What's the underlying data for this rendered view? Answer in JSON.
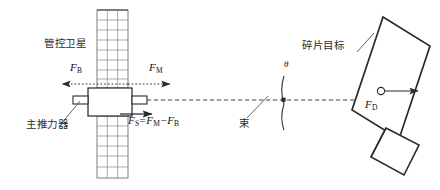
{
  "diagram": {
    "title_hidden": "",
    "satellite": {
      "label": "管控卫星",
      "thruster_label": "主推力器",
      "force_back": {
        "symbol": "F",
        "sub": "B"
      },
      "force_main": {
        "symbol": "F",
        "sub": "M"
      },
      "resultant": {
        "symbol": "F",
        "sub": "S",
        "equals": "=",
        "term1_symbol": "F",
        "term1_sub": "M",
        "minus": "−",
        "term2_symbol": "F",
        "term2_sub": "B"
      }
    },
    "beam": {
      "label": "束",
      "angle_label": "θ"
    },
    "debris": {
      "label": "碎片目标",
      "force": {
        "symbol": "F",
        "sub": "D"
      }
    },
    "colors": {
      "line": "#2a2a2a",
      "panel_grid": "#8a8a8a",
      "dashed": "#3a3a3a",
      "text": "#1f1f1f",
      "background": "#ffffff"
    }
  }
}
